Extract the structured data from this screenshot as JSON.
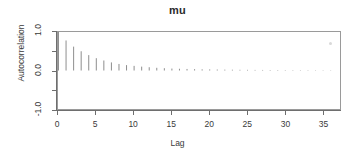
{
  "chart_data": {
    "type": "bar",
    "title": "mu",
    "xlabel": "Lag",
    "ylabel": "Autocorrelation",
    "xlim": [
      0,
      37.3
    ],
    "ylim": [
      -1.0,
      1.0
    ],
    "grid": false,
    "legend": null,
    "x_ticks": [
      0,
      5,
      10,
      15,
      20,
      25,
      30,
      35
    ],
    "x_tick_labels": [
      "0",
      "5",
      "10",
      "15",
      "20",
      "25",
      "30",
      "35"
    ],
    "y_ticks": [
      -1.0,
      -0.5,
      0.0,
      0.5,
      1.0
    ],
    "y_tick_labels": [
      "-1.0",
      "",
      "0.0",
      "",
      "1.0"
    ],
    "y_labeled_ticks": [
      {
        "value": 1.0,
        "label": "1.0"
      },
      {
        "value": 0.0,
        "label": "0.0"
      },
      {
        "value": -1.0,
        "label": "-1.0"
      }
    ],
    "baseline": 0.0,
    "bar_color": "#8c8c8c",
    "categories": [
      0,
      1,
      2,
      3,
      4,
      5,
      6,
      7,
      8,
      9,
      10,
      11,
      12,
      13,
      14,
      15,
      16,
      17,
      18,
      19,
      20,
      21,
      22,
      23,
      24,
      25,
      26,
      27,
      28,
      29,
      30,
      31,
      32,
      33,
      34,
      35,
      36
    ],
    "values": [
      1.0,
      0.78,
      0.62,
      0.5,
      0.4,
      0.32,
      0.26,
      0.21,
      0.17,
      0.14,
      0.12,
      0.1,
      0.085,
      0.07,
      0.06,
      0.05,
      0.045,
      0.04,
      0.035,
      0.03,
      0.028,
      0.025,
      0.022,
      0.02,
      0.018,
      0.017,
      0.015,
      0.014,
      0.013,
      0.012,
      0.011,
      0.01,
      0.009,
      0.009,
      0.008,
      0.008,
      0.007
    ]
  },
  "chart": {
    "title": "mu",
    "x_axis_title": "Lag",
    "y_axis_title": "Autocorrelation"
  }
}
